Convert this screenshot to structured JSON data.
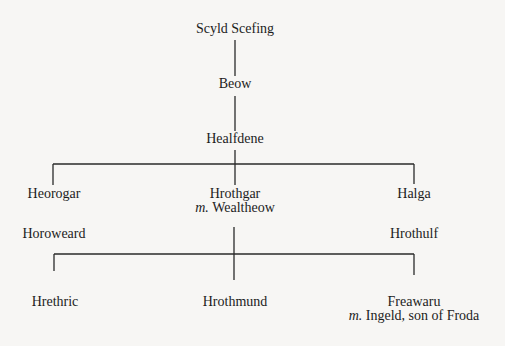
{
  "diagram": {
    "type": "family-tree",
    "line_color": "#2a2a2a",
    "background": "#f7f6f4",
    "nodes": {
      "scyld": {
        "name": "Scyld Scefing"
      },
      "beow": {
        "name": "Beow"
      },
      "healfdene": {
        "name": "Healfdene"
      },
      "heorogar": {
        "name": "Heorogar"
      },
      "hrothgar": {
        "name": "Hrothgar",
        "spouse_prefix": "m.",
        "spouse": "Wealtheow"
      },
      "halga": {
        "name": "Halga"
      },
      "horoweard": {
        "name": "Horoweard"
      },
      "hrothulf": {
        "name": "Hrothulf"
      },
      "hrethric": {
        "name": "Hrethric"
      },
      "hrothmund": {
        "name": "Hrothmund"
      },
      "freawaru": {
        "name": "Freawaru",
        "spouse_prefix": "m.",
        "spouse": "Ingeld, son of Froda"
      }
    },
    "edges": [
      [
        "Scyld Scefing",
        "Beow"
      ],
      [
        "Beow",
        "Healfdene"
      ],
      [
        "Healfdene",
        "Heorogar"
      ],
      [
        "Healfdene",
        "Hrothgar"
      ],
      [
        "Healfdene",
        "Halga"
      ],
      [
        "Heorogar",
        "Horoweard"
      ],
      [
        "Halga",
        "Hrothulf"
      ],
      [
        "Hrothgar",
        "Hrethric"
      ],
      [
        "Hrothgar",
        "Hrothmund"
      ],
      [
        "Hrothgar",
        "Freawaru"
      ]
    ]
  }
}
